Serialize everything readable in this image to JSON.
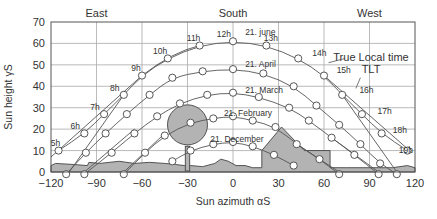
{
  "chart_data": {
    "type": "line",
    "title": "",
    "xlabel": "Sun azimuth αS",
    "ylabel": "Sun height γS",
    "xlim": [
      -120,
      120
    ],
    "ylim": [
      0,
      70
    ],
    "xticks": [
      -120,
      -90,
      -60,
      -30,
      0,
      30,
      60,
      90,
      120
    ],
    "yticks": [
      0,
      10,
      20,
      30,
      40,
      50,
      60,
      70
    ],
    "grid": true,
    "direction_labels": [
      {
        "label": "East",
        "x": -90
      },
      {
        "label": "South",
        "x": 0
      },
      {
        "label": "West",
        "x": 90
      }
    ],
    "series": [
      {
        "name": "21. June",
        "label": "21. june",
        "points": [
          [
            -115,
            10
          ],
          [
            -98,
            18
          ],
          [
            -85,
            27
          ],
          [
            -72,
            36
          ],
          [
            -60,
            45
          ],
          [
            -43,
            53
          ],
          [
            -22,
            59
          ],
          [
            0,
            61
          ],
          [
            22,
            59
          ],
          [
            43,
            53
          ],
          [
            60,
            45
          ],
          [
            72,
            36
          ],
          [
            85,
            27
          ],
          [
            98,
            18
          ],
          [
            115,
            10
          ]
        ]
      },
      {
        "name": "21. April",
        "label": "21. April",
        "points": [
          [
            -110,
            -1
          ],
          [
            -97,
            9
          ],
          [
            -84,
            18
          ],
          [
            -70,
            27
          ],
          [
            -55,
            36
          ],
          [
            -40,
            44
          ],
          [
            -20,
            47
          ],
          [
            0,
            48
          ],
          [
            20,
            46
          ],
          [
            40,
            40
          ],
          [
            55,
            31
          ],
          [
            70,
            22
          ],
          [
            84,
            13
          ],
          [
            97,
            4
          ],
          [
            108,
            -1
          ]
        ]
      },
      {
        "name": "21. March",
        "label": "21. March",
        "points": [
          [
            -98,
            -1
          ],
          [
            -80,
            9
          ],
          [
            -65,
            18
          ],
          [
            -50,
            26
          ],
          [
            -35,
            32
          ],
          [
            -17,
            36
          ],
          [
            0,
            37
          ],
          [
            17,
            35
          ],
          [
            37,
            30
          ],
          [
            50,
            24
          ],
          [
            65,
            16
          ],
          [
            80,
            8
          ],
          [
            96,
            -1
          ]
        ]
      },
      {
        "name": "21. February",
        "label": "21. February",
        "points": [
          [
            -72,
            -1
          ],
          [
            -58,
            9
          ],
          [
            -45,
            17
          ],
          [
            -28,
            23
          ],
          [
            -13,
            25
          ],
          [
            0,
            26
          ],
          [
            13,
            24
          ],
          [
            28,
            21
          ],
          [
            42,
            13
          ],
          [
            57,
            6
          ],
          [
            70,
            -1
          ]
        ]
      },
      {
        "name": "21. December",
        "label": "21. December",
        "points": [
          [
            -40,
            5
          ],
          [
            -28,
            10
          ],
          [
            -13,
            13
          ],
          [
            0,
            14
          ],
          [
            13,
            12
          ],
          [
            27,
            8
          ],
          [
            40,
            3
          ]
        ]
      }
    ],
    "hour_labels": [
      {
        "label": "5h",
        "x": -117,
        "y": 12
      },
      {
        "label": "6h",
        "x": -104,
        "y": 20
      },
      {
        "label": "7h",
        "x": -91,
        "y": 29
      },
      {
        "label": "8h",
        "x": -78,
        "y": 38
      },
      {
        "label": "9h",
        "x": -64,
        "y": 47
      },
      {
        "label": "10h",
        "x": -48,
        "y": 55
      },
      {
        "label": "11h",
        "x": -26,
        "y": 61
      },
      {
        "label": "12h",
        "x": -6,
        "y": 63
      },
      {
        "label": "13h",
        "x": 25,
        "y": 61
      },
      {
        "label": "14h",
        "x": 57,
        "y": 54
      },
      {
        "label": "15h",
        "x": 73,
        "y": 46
      },
      {
        "label": "16h",
        "x": 88,
        "y": 37
      },
      {
        "label": "17h",
        "x": 100,
        "y": 27
      },
      {
        "label": "18h",
        "x": 110,
        "y": 18
      },
      {
        "label": "19h",
        "x": 114,
        "y": 9
      }
    ],
    "date_labels": [
      {
        "label": "21. june",
        "x": 8,
        "y": 64
      },
      {
        "label": "21. April",
        "x": 8,
        "y": 49
      },
      {
        "label": "21. March",
        "x": 8,
        "y": 37
      },
      {
        "label": "21. February",
        "x": -6,
        "y": 26
      },
      {
        "label": "21. December",
        "x": -15,
        "y": 14
      }
    ],
    "annotation": {
      "line1": "True Local time",
      "line2": "TLT"
    },
    "obstacles": {
      "horizon": [
        [
          -120,
          0
        ],
        [
          -120,
          3
        ],
        [
          -117,
          4
        ],
        [
          -105,
          3.5
        ],
        [
          -96,
          3
        ],
        [
          -95,
          4.5
        ],
        [
          -88,
          4
        ],
        [
          -75,
          5
        ],
        [
          -65,
          4
        ],
        [
          -55,
          4.5
        ],
        [
          -45,
          4
        ],
        [
          -38,
          3.5
        ],
        [
          -32,
          3
        ],
        [
          -28,
          3
        ],
        [
          -20,
          2.5
        ],
        [
          -12,
          4
        ],
        [
          -8,
          6
        ],
        [
          -3,
          5
        ],
        [
          2,
          3
        ],
        [
          8,
          3
        ],
        [
          13,
          2
        ],
        [
          19,
          2
        ],
        [
          19,
          10
        ],
        [
          32,
          21
        ],
        [
          47,
          10
        ],
        [
          64,
          10
        ],
        [
          64,
          2
        ],
        [
          75,
          2
        ],
        [
          90,
          2
        ],
        [
          105,
          2
        ],
        [
          115,
          3
        ],
        [
          120,
          2
        ],
        [
          120,
          0
        ]
      ],
      "tree": {
        "trunk_x": -30,
        "trunk_w": 2.2,
        "trunk_top": 12,
        "crown_cx": -30,
        "crown_cy": 22,
        "crown_r": 10
      }
    }
  }
}
